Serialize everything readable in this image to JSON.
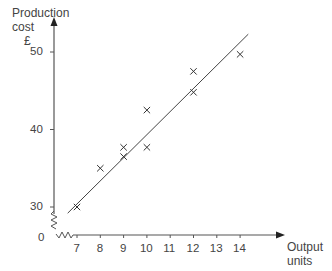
{
  "chart_data": {
    "type": "scatter",
    "title": "",
    "xlabel": "Output units",
    "ylabel": "Production cost £",
    "ylabel_lines": [
      "Production",
      "cost",
      "£"
    ],
    "xlabel_lines": [
      "Output",
      "units"
    ],
    "x_ticks": [
      7,
      8,
      9,
      10,
      11,
      12,
      13,
      14
    ],
    "y_ticks": [
      30,
      40,
      50
    ],
    "origin_label": "0",
    "axis_breaks": true,
    "xlim": [
      6.5,
      15
    ],
    "ylim": [
      28,
      52
    ],
    "grid": false,
    "legend": null,
    "series": [
      {
        "name": "observations",
        "marker": "x",
        "points": [
          {
            "x": 7,
            "y": 30
          },
          {
            "x": 8,
            "y": 35
          },
          {
            "x": 9,
            "y": 36.5
          },
          {
            "x": 9,
            "y": 37.7
          },
          {
            "x": 10,
            "y": 37.7
          },
          {
            "x": 10,
            "y": 42.5
          },
          {
            "x": 12,
            "y": 44.8
          },
          {
            "x": 12,
            "y": 47.5
          },
          {
            "x": 14,
            "y": 49.7
          }
        ]
      },
      {
        "name": "line of best fit",
        "type": "line",
        "points": [
          {
            "x": 6.6,
            "y": 29.2
          },
          {
            "x": 14.35,
            "y": 52.3
          }
        ]
      }
    ]
  }
}
